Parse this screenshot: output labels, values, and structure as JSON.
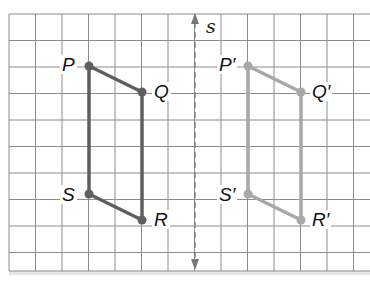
{
  "figure": {
    "type": "reflection-on-grid",
    "line_of_reflection": {
      "label": "s",
      "style": "dashed",
      "arrows": "both ends"
    },
    "original": {
      "name": "PQRS",
      "color": "#5f5f5f",
      "vertices": [
        {
          "label": "P",
          "grid": [
            3,
            2
          ]
        },
        {
          "label": "Q",
          "grid": [
            5,
            3
          ]
        },
        {
          "label": "R",
          "grid": [
            5,
            8
          ]
        },
        {
          "label": "S",
          "grid": [
            3,
            7
          ]
        }
      ]
    },
    "image": {
      "name": "P'Q'R'S'",
      "color": "#a8a8a8",
      "vertices": [
        {
          "label": "P′",
          "grid": [
            9,
            2
          ]
        },
        {
          "label": "Q′",
          "grid": [
            11,
            3
          ]
        },
        {
          "label": "R′",
          "grid": [
            11,
            8
          ]
        },
        {
          "label": "S′",
          "grid": [
            9,
            7
          ]
        }
      ]
    },
    "grid": {
      "columns": 14,
      "rows": 10,
      "line_color": "#8a8a8a"
    }
  },
  "labels": {
    "P": "P",
    "Q": "Q",
    "R": "R",
    "S": "S",
    "P_prime": "P′",
    "Q_prime": "Q′",
    "R_prime": "R′",
    "S_prime": "S′",
    "axis": "s"
  }
}
